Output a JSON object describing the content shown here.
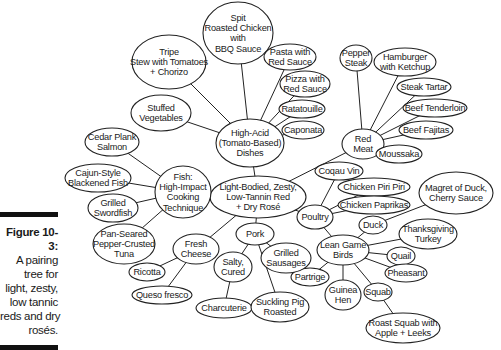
{
  "caption": {
    "figure_label": "Figure 10-3:",
    "lines": [
      "A pairing",
      "tree for",
      "light, zesty,",
      "low tannic",
      "reds and dry",
      "rosés."
    ]
  },
  "nodes": [
    {
      "id": "root",
      "lines": [
        "Light-Bodied, Zesty,",
        "Low-Tannin Red",
        "+ Dry Rosé"
      ],
      "cx": 258,
      "cy": 197,
      "rx": 48,
      "ry": 21
    },
    {
      "id": "high_acid",
      "lines": [
        "High-Acid",
        "(Tomato-Based)",
        "Dishes"
      ],
      "cx": 250,
      "cy": 143,
      "rx": 34,
      "ry": 24
    },
    {
      "id": "spit_chicken",
      "lines": [
        "Spit",
        "Roasted Chicken",
        "with",
        "BBQ Sauce"
      ],
      "cx": 238,
      "cy": 33,
      "rx": 35,
      "ry": 31
    },
    {
      "id": "tripe",
      "lines": [
        "Tripe",
        "Stew with Tomatoes",
        "+ Chorizo"
      ],
      "cx": 169,
      "cy": 62,
      "rx": 37,
      "ry": 27
    },
    {
      "id": "pasta",
      "lines": [
        "Pasta with",
        "Red Sauce"
      ],
      "cx": 290,
      "cy": 57,
      "rx": 26,
      "ry": 13
    },
    {
      "id": "pizza",
      "lines": [
        "Pizza with",
        "Red Sauce"
      ],
      "cx": 305,
      "cy": 84,
      "rx": 25,
      "ry": 13
    },
    {
      "id": "ratatouille",
      "lines": [
        "Ratatouille"
      ],
      "cx": 302,
      "cy": 109,
      "rx": 23,
      "ry": 9
    },
    {
      "id": "caponata",
      "lines": [
        "Caponata"
      ],
      "cx": 303,
      "cy": 130,
      "rx": 21,
      "ry": 9
    },
    {
      "id": "stuffed_veg",
      "lines": [
        "Stuffed",
        "Vegetables"
      ],
      "cx": 161,
      "cy": 113,
      "rx": 30,
      "ry": 18
    },
    {
      "id": "red_meat",
      "lines": [
        "Red",
        "Meat"
      ],
      "cx": 363,
      "cy": 144,
      "rx": 21,
      "ry": 15
    },
    {
      "id": "pepper_steak",
      "lines": [
        "Pepper",
        "Steak"
      ],
      "cx": 356,
      "cy": 58,
      "rx": 16,
      "ry": 13
    },
    {
      "id": "hamburger",
      "lines": [
        "Hamburger",
        "with Ketchup"
      ],
      "cx": 405,
      "cy": 62,
      "rx": 31,
      "ry": 14
    },
    {
      "id": "steak_tartar",
      "lines": [
        "Steak Tartar"
      ],
      "cx": 424,
      "cy": 87,
      "rx": 27,
      "ry": 9
    },
    {
      "id": "beef_tenderloin",
      "lines": [
        "Beef Tenderloin"
      ],
      "cx": 435,
      "cy": 108,
      "rx": 32,
      "ry": 9
    },
    {
      "id": "beef_fajitas",
      "lines": [
        "Beef Fajitas"
      ],
      "cx": 426,
      "cy": 130,
      "rx": 27,
      "ry": 9
    },
    {
      "id": "moussaka",
      "lines": [
        "Moussaka"
      ],
      "cx": 399,
      "cy": 154,
      "rx": 23,
      "ry": 9
    },
    {
      "id": "coqau_vin",
      "lines": [
        "Coqau Vin"
      ],
      "cx": 339,
      "cy": 171,
      "rx": 24,
      "ry": 9
    },
    {
      "id": "chicken_piri",
      "lines": [
        "Chicken Piri Piri"
      ],
      "cx": 374,
      "cy": 187,
      "rx": 36,
      "ry": 9
    },
    {
      "id": "chicken_paprikas",
      "lines": [
        "Chicken Paprikas"
      ],
      "cx": 374,
      "cy": 205,
      "rx": 36,
      "ry": 9
    },
    {
      "id": "magret",
      "lines": [
        "Magret of Duck,",
        "Cherry Sauce"
      ],
      "cx": 456,
      "cy": 193,
      "rx": 37,
      "ry": 21
    },
    {
      "id": "poultry",
      "lines": [
        "Poultry"
      ],
      "cx": 315,
      "cy": 217,
      "rx": 18,
      "ry": 12
    },
    {
      "id": "lean_game",
      "lines": [
        "Lean Game",
        "Birds"
      ],
      "cx": 343,
      "cy": 250,
      "rx": 26,
      "ry": 15
    },
    {
      "id": "duck",
      "lines": [
        "Duck"
      ],
      "cx": 373,
      "cy": 225,
      "rx": 14,
      "ry": 9
    },
    {
      "id": "thanksgiving",
      "lines": [
        "Thanksgiving",
        "Turkey"
      ],
      "cx": 428,
      "cy": 234,
      "rx": 29,
      "ry": 15
    },
    {
      "id": "quail",
      "lines": [
        "Quail"
      ],
      "cx": 401,
      "cy": 256,
      "rx": 14,
      "ry": 9
    },
    {
      "id": "pheasant",
      "lines": [
        "Pheasant"
      ],
      "cx": 406,
      "cy": 273,
      "rx": 21,
      "ry": 9
    },
    {
      "id": "partrige",
      "lines": [
        "Partrige"
      ],
      "cx": 310,
      "cy": 277,
      "rx": 19,
      "ry": 9
    },
    {
      "id": "guinea_hen",
      "lines": [
        "Guinea",
        "Hen"
      ],
      "cx": 343,
      "cy": 295,
      "rx": 18,
      "ry": 15
    },
    {
      "id": "squab",
      "lines": [
        "Squab"
      ],
      "cx": 378,
      "cy": 292,
      "rx": 14,
      "ry": 9
    },
    {
      "id": "roast_squab",
      "lines": [
        "Roast Squab with",
        "Apple + Leeks"
      ],
      "cx": 403,
      "cy": 328,
      "rx": 37,
      "ry": 15
    },
    {
      "id": "pork",
      "lines": [
        "Pork"
      ],
      "cx": 255,
      "cy": 234,
      "rx": 19,
      "ry": 11
    },
    {
      "id": "grilled_sausages",
      "lines": [
        "Grilled",
        "Sausages"
      ],
      "cx": 286,
      "cy": 258,
      "rx": 25,
      "ry": 15
    },
    {
      "id": "salty_cured",
      "lines": [
        "Salty,",
        "Cured"
      ],
      "cx": 233,
      "cy": 267,
      "rx": 19,
      "ry": 15
    },
    {
      "id": "charcuterie",
      "lines": [
        "Charcuterie"
      ],
      "cx": 224,
      "cy": 308,
      "rx": 28,
      "ry": 10
    },
    {
      "id": "suckling_pig",
      "lines": [
        "Suckling Pig",
        "Roasted"
      ],
      "cx": 280,
      "cy": 307,
      "rx": 29,
      "ry": 15
    },
    {
      "id": "fresh_cheese",
      "lines": [
        "Fresh",
        "Cheese"
      ],
      "cx": 196,
      "cy": 249,
      "rx": 23,
      "ry": 15
    },
    {
      "id": "ricotta",
      "lines": [
        "Ricotta"
      ],
      "cx": 147,
      "cy": 272,
      "rx": 18,
      "ry": 9
    },
    {
      "id": "queso",
      "lines": [
        "Queso fresco"
      ],
      "cx": 162,
      "cy": 295,
      "rx": 30,
      "ry": 9
    },
    {
      "id": "fish",
      "lines": [
        "Fish:",
        "High-Impact",
        "Cooking",
        "Technique"
      ],
      "cx": 183,
      "cy": 192,
      "rx": 28,
      "ry": 26
    },
    {
      "id": "cedar",
      "lines": [
        "Cedar Plank",
        "Salmon"
      ],
      "cx": 112,
      "cy": 142,
      "rx": 27,
      "ry": 14
    },
    {
      "id": "cajun",
      "lines": [
        "Cajun-Style",
        "Blackened Fish"
      ],
      "cx": 98,
      "cy": 178,
      "rx": 33,
      "ry": 14
    },
    {
      "id": "swordfish",
      "lines": [
        "Grilled",
        "Swordfish"
      ],
      "cx": 113,
      "cy": 208,
      "rx": 25,
      "ry": 14
    },
    {
      "id": "tuna",
      "lines": [
        "Pan-Seared",
        "Pepper-Crusted",
        "Tuna"
      ],
      "cx": 124,
      "cy": 244,
      "rx": 31,
      "ry": 20
    }
  ],
  "edges": [
    [
      "root",
      "high_acid"
    ],
    [
      "root",
      "red_meat"
    ],
    [
      "root",
      "poultry"
    ],
    [
      "root",
      "pork"
    ],
    [
      "root",
      "fresh_cheese"
    ],
    [
      "root",
      "fish"
    ],
    [
      "high_acid",
      "spit_chicken"
    ],
    [
      "high_acid",
      "tripe"
    ],
    [
      "high_acid",
      "pasta"
    ],
    [
      "high_acid",
      "pizza"
    ],
    [
      "high_acid",
      "ratatouille"
    ],
    [
      "high_acid",
      "caponata"
    ],
    [
      "high_acid",
      "stuffed_veg"
    ],
    [
      "red_meat",
      "pepper_steak"
    ],
    [
      "red_meat",
      "hamburger"
    ],
    [
      "red_meat",
      "steak_tartar"
    ],
    [
      "red_meat",
      "beef_tenderloin"
    ],
    [
      "red_meat",
      "beef_fajitas"
    ],
    [
      "red_meat",
      "moussaka"
    ],
    [
      "poultry",
      "coqau_vin"
    ],
    [
      "poultry",
      "chicken_piri"
    ],
    [
      "poultry",
      "chicken_paprikas"
    ],
    [
      "poultry",
      "lean_game"
    ],
    [
      "lean_game",
      "duck"
    ],
    [
      "duck",
      "magret"
    ],
    [
      "lean_game",
      "thanksgiving"
    ],
    [
      "lean_game",
      "quail"
    ],
    [
      "lean_game",
      "pheasant"
    ],
    [
      "lean_game",
      "partrige"
    ],
    [
      "lean_game",
      "guinea_hen"
    ],
    [
      "lean_game",
      "squab"
    ],
    [
      "squab",
      "roast_squab"
    ],
    [
      "pork",
      "grilled_sausages"
    ],
    [
      "pork",
      "salty_cured"
    ],
    [
      "pork",
      "suckling_pig"
    ],
    [
      "salty_cured",
      "charcuterie"
    ],
    [
      "fresh_cheese",
      "ricotta"
    ],
    [
      "fresh_cheese",
      "queso"
    ],
    [
      "fish",
      "cedar"
    ],
    [
      "fish",
      "cajun"
    ],
    [
      "fish",
      "swordfish"
    ],
    [
      "fish",
      "tuna"
    ]
  ]
}
